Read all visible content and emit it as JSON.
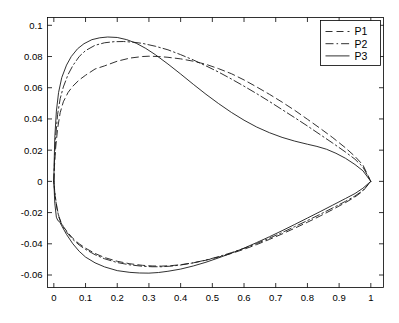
{
  "figure": {
    "title": "",
    "background": "#ffffff",
    "line_color": "#1a1a1a"
  },
  "axes": {
    "x_tick_labels": [
      "0",
      "0.1",
      "0.2",
      "0.3",
      "0.4",
      "0.5",
      "0.6",
      "0.7",
      "0.8",
      "0.9",
      "1"
    ],
    "y_tick_labels": [
      "0.1",
      "0.08",
      "0.06",
      "0.04",
      "0.02",
      "0",
      "-0.02",
      "-0.04",
      "-0.06"
    ],
    "xlabel": "",
    "ylabel": ""
  },
  "legend": {
    "entries": [
      {
        "label": "P1",
        "style": "dashed"
      },
      {
        "label": "P2",
        "style": "dashdot"
      },
      {
        "label": "P3",
        "style": "solid"
      }
    ]
  },
  "chart_data": {
    "type": "line",
    "title": "",
    "xlabel": "",
    "ylabel": "",
    "xlim": [
      -0.02,
      1.04
    ],
    "ylim": [
      -0.068,
      0.105
    ],
    "x_ticks": [
      0,
      0.1,
      0.2,
      0.3,
      0.4,
      0.5,
      0.6,
      0.7,
      0.8,
      0.9,
      1
    ],
    "y_ticks": [
      0.1,
      0.08,
      0.06,
      0.04,
      0.02,
      0,
      -0.02,
      -0.04,
      -0.06
    ],
    "grid": false,
    "legend_position": "upper right",
    "series": [
      {
        "name": "P1",
        "style": "dashed",
        "upper_surface": {
          "x": [
            0.0,
            0.002,
            0.006,
            0.012,
            0.02,
            0.03,
            0.045,
            0.06,
            0.08,
            0.1,
            0.13,
            0.16,
            0.2,
            0.24,
            0.28,
            0.3,
            0.33,
            0.36,
            0.4,
            0.44,
            0.48,
            0.52,
            0.56,
            0.6,
            0.64,
            0.68,
            0.72,
            0.76,
            0.8,
            0.84,
            0.88,
            0.92,
            0.95,
            0.975,
            1.0
          ],
          "y": [
            0.0,
            0.01,
            0.022,
            0.034,
            0.044,
            0.051,
            0.057,
            0.061,
            0.065,
            0.068,
            0.072,
            0.074,
            0.077,
            0.079,
            0.08,
            0.0802,
            0.08,
            0.0795,
            0.0785,
            0.077,
            0.075,
            0.0722,
            0.069,
            0.065,
            0.0605,
            0.0558,
            0.0508,
            0.0455,
            0.0398,
            0.034,
            0.028,
            0.0215,
            0.016,
            0.0105,
            0.0
          ]
        },
        "lower_surface": {
          "x": [
            0.0,
            0.004,
            0.01,
            0.016,
            0.022,
            0.03,
            0.045,
            0.06,
            0.08,
            0.1,
            0.13,
            0.16,
            0.2,
            0.24,
            0.28,
            0.31,
            0.34,
            0.37,
            0.4,
            0.44,
            0.48,
            0.52,
            0.56,
            0.6,
            0.64,
            0.68,
            0.72,
            0.76,
            0.8,
            0.84,
            0.88,
            0.92,
            0.95,
            0.975,
            1.0
          ],
          "y": [
            0.0,
            -0.009,
            -0.017,
            -0.0225,
            -0.0258,
            -0.029,
            -0.033,
            -0.0365,
            -0.04,
            -0.0428,
            -0.0462,
            -0.0488,
            -0.0512,
            -0.0528,
            -0.0538,
            -0.0542,
            -0.0543,
            -0.054,
            -0.0534,
            -0.0522,
            -0.0505,
            -0.0485,
            -0.0462,
            -0.0435,
            -0.0405,
            -0.0372,
            -0.0337,
            -0.03,
            -0.0262,
            -0.0222,
            -0.018,
            -0.0136,
            -0.01,
            -0.0062,
            0.0
          ]
        }
      },
      {
        "name": "P2",
        "style": "dashdot",
        "upper_surface": {
          "x": [
            0.0,
            0.002,
            0.006,
            0.012,
            0.02,
            0.03,
            0.045,
            0.06,
            0.08,
            0.1,
            0.13,
            0.16,
            0.19,
            0.22,
            0.25,
            0.28,
            0.32,
            0.36,
            0.4,
            0.44,
            0.48,
            0.52,
            0.56,
            0.6,
            0.64,
            0.68,
            0.72,
            0.76,
            0.8,
            0.84,
            0.88,
            0.92,
            0.95,
            0.975,
            1.0
          ],
          "y": [
            0.0,
            0.013,
            0.029,
            0.043,
            0.053,
            0.0605,
            0.0685,
            0.0742,
            0.08,
            0.0838,
            0.0872,
            0.0888,
            0.0895,
            0.0896,
            0.0892,
            0.0884,
            0.0866,
            0.0843,
            0.0812,
            0.0778,
            0.074,
            0.07,
            0.0656,
            0.061,
            0.0562,
            0.0512,
            0.046,
            0.0408,
            0.0355,
            0.03,
            0.0245,
            0.0188,
            0.0142,
            0.0092,
            0.0
          ]
        },
        "lower_surface": {
          "x": [
            0.0,
            0.004,
            0.01,
            0.016,
            0.022,
            0.03,
            0.045,
            0.06,
            0.08,
            0.1,
            0.13,
            0.16,
            0.2,
            0.24,
            0.28,
            0.31,
            0.34,
            0.37,
            0.4,
            0.44,
            0.48,
            0.52,
            0.56,
            0.6,
            0.64,
            0.68,
            0.72,
            0.76,
            0.8,
            0.84,
            0.88,
            0.92,
            0.95,
            0.975,
            1.0
          ],
          "y": [
            0.0,
            -0.0095,
            -0.0175,
            -0.023,
            -0.0262,
            -0.0295,
            -0.0338,
            -0.0372,
            -0.0408,
            -0.0436,
            -0.047,
            -0.0496,
            -0.052,
            -0.0535,
            -0.0544,
            -0.0547,
            -0.0547,
            -0.0543,
            -0.0536,
            -0.0522,
            -0.0504,
            -0.0482,
            -0.0457,
            -0.0429,
            -0.0398,
            -0.0364,
            -0.0328,
            -0.029,
            -0.0251,
            -0.0211,
            -0.017,
            -0.0128,
            -0.0094,
            -0.0058,
            0.0
          ]
        }
      },
      {
        "name": "P3",
        "style": "solid",
        "upper_surface": {
          "x": [
            0.0,
            0.001,
            0.003,
            0.008,
            0.015,
            0.025,
            0.04,
            0.055,
            0.075,
            0.095,
            0.12,
            0.145,
            0.17,
            0.2,
            0.23,
            0.26,
            0.29,
            0.32,
            0.36,
            0.4,
            0.44,
            0.48,
            0.52,
            0.56,
            0.6,
            0.64,
            0.68,
            0.72,
            0.76,
            0.8,
            0.83,
            0.86,
            0.89,
            0.92,
            0.95,
            0.975,
            1.0
          ],
          "y": [
            0.0,
            0.012,
            0.028,
            0.045,
            0.057,
            0.0665,
            0.0745,
            0.08,
            0.085,
            0.0882,
            0.0908,
            0.092,
            0.0925,
            0.0922,
            0.0908,
            0.0885,
            0.0852,
            0.0812,
            0.0752,
            0.0688,
            0.0622,
            0.0558,
            0.0498,
            0.0442,
            0.0392,
            0.0348,
            0.0312,
            0.0282,
            0.0258,
            0.0238,
            0.0224,
            0.0206,
            0.018,
            0.0148,
            0.0108,
            0.0068,
            0.0
          ]
        },
        "lower_surface": {
          "x": [
            0.0,
            0.003,
            0.008,
            0.013,
            0.018,
            0.025,
            0.04,
            0.06,
            0.08,
            0.1,
            0.13,
            0.16,
            0.2,
            0.24,
            0.27,
            0.3,
            0.33,
            0.36,
            0.4,
            0.44,
            0.48,
            0.52,
            0.56,
            0.6,
            0.64,
            0.68,
            0.72,
            0.76,
            0.8,
            0.84,
            0.88,
            0.92,
            0.95,
            0.975,
            1.0
          ],
          "y": [
            0.0,
            -0.014,
            -0.023,
            -0.0252,
            -0.0258,
            -0.0285,
            -0.034,
            -0.04,
            -0.0448,
            -0.0485,
            -0.0522,
            -0.0548,
            -0.0572,
            -0.0583,
            -0.0587,
            -0.0588,
            -0.0584,
            -0.0576,
            -0.0562,
            -0.0542,
            -0.0518,
            -0.049,
            -0.046,
            -0.0428,
            -0.0392,
            -0.0355,
            -0.0316,
            -0.0276,
            -0.0235,
            -0.0194,
            -0.0152,
            -0.011,
            -0.0078,
            -0.0044,
            0.0
          ]
        }
      }
    ]
  }
}
